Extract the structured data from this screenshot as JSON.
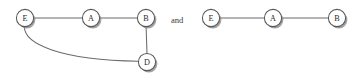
{
  "figure": {
    "width": 364,
    "height": 79,
    "background_color": "#ffffff",
    "conjunction_label": "and",
    "conjunction_x": 171,
    "conjunction_y": 20
  },
  "style": {
    "node_radius": 8.6,
    "node_fill": "#ffffff",
    "node_stroke": "#595959",
    "node_stroke_width": 1.05,
    "node_shadow_color": "#8f8f8f",
    "node_shadow_offset_x": 1.8,
    "node_shadow_offset_y": 1.8,
    "edge_color": "#6b6b6b",
    "edge_width": 1.05,
    "label_color": "#2b2b2b",
    "label_font_size": 8.2
  },
  "graphs": [
    {
      "id": "graph-left",
      "name": "left-graph",
      "nodes": [
        {
          "id": "E",
          "label": "E",
          "cx": 25,
          "cy": 18
        },
        {
          "id": "A",
          "label": "A",
          "cx": 91,
          "cy": 18
        },
        {
          "id": "B",
          "label": "B",
          "cx": 146,
          "cy": 18
        },
        {
          "id": "D",
          "label": "D",
          "cx": 147,
          "cy": 62
        }
      ],
      "edges": [
        {
          "id": "E-A",
          "from": "E",
          "to": "A",
          "type": "straight",
          "path": "M 33.6 18 L 82.4 18"
        },
        {
          "id": "A-B",
          "from": "A",
          "to": "B",
          "type": "straight",
          "path": "M 99.6 18 L 137.4 18"
        },
        {
          "id": "B-D",
          "from": "B",
          "to": "D",
          "type": "straight",
          "path": "M 146.1 26.6 L 147 53.4"
        },
        {
          "id": "E-D",
          "from": "E",
          "to": "D",
          "type": "curved",
          "path": "M 24.4 26.6 C 24 44 60 60 138.5 61.2"
        }
      ]
    },
    {
      "id": "graph-right",
      "name": "right-graph",
      "nodes": [
        {
          "id": "E",
          "label": "E",
          "cx": 211,
          "cy": 18
        },
        {
          "id": "A",
          "label": "A",
          "cx": 273,
          "cy": 18
        },
        {
          "id": "B",
          "label": "B",
          "cx": 337,
          "cy": 18
        }
      ],
      "edges": [
        {
          "id": "E-A",
          "from": "E",
          "to": "A",
          "type": "straight",
          "path": "M 219.6 18 L 264.4 18"
        },
        {
          "id": "A-B",
          "from": "A",
          "to": "B",
          "type": "straight",
          "path": "M 281.6 18 L 328.4 18"
        }
      ]
    }
  ]
}
